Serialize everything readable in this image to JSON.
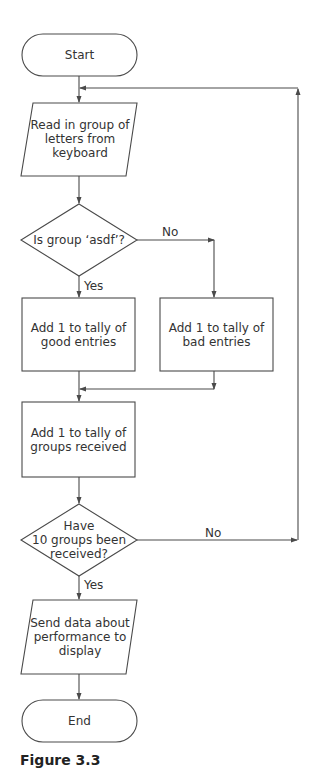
{
  "nodes": {
    "start": "Start",
    "read_input": "Read in group of\nletters from\nkeyboard",
    "decision_asdf": "Is group ‘asdf’?",
    "good_tally": "Add 1 to tally of\ngood entries",
    "bad_tally": "Add 1 to tally of\nbad entries",
    "groups_tally": "Add 1 to tally of\ngroups received",
    "decision_ten": "Have\n10 groups been\nreceived?",
    "send_output": "Send data about\nperformance to\ndisplay",
    "end": "End"
  },
  "edges": {
    "asdf_no": "No",
    "asdf_yes": "Yes",
    "ten_no": "No",
    "ten_yes": "Yes"
  },
  "caption": "Figure 3.3",
  "colors": {
    "stroke": "#4a4a4a",
    "text": "#333333",
    "background": "#ffffff"
  }
}
